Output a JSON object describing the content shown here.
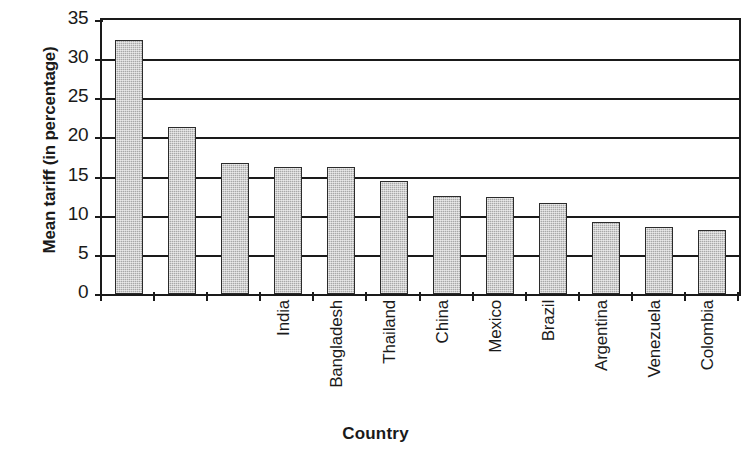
{
  "chart_data": {
    "type": "bar",
    "title": "",
    "xlabel": "Country",
    "ylabel": "Mean tariff (in percentage)",
    "categories": [
      "India",
      "Bangladesh",
      "Thailand",
      "China",
      "Mexico",
      "Brazil",
      "Argentina",
      "Venezuela",
      "Colombia",
      "Malaysia",
      "Korea",
      "Indonesia"
    ],
    "values": [
      32.4,
      21.3,
      16.7,
      16.2,
      16.2,
      14.4,
      12.5,
      12.4,
      11.6,
      9.2,
      8.5,
      8.2
    ],
    "ylim": [
      0,
      35
    ],
    "ytick_labels": [
      "0",
      "5",
      "10",
      "15",
      "20",
      "25",
      "30",
      "35"
    ],
    "ytick_values": [
      0,
      5,
      10,
      15,
      20,
      25,
      30,
      35
    ],
    "grid": true,
    "grid_axis": "y",
    "legend": false,
    "bar_color": "#a8a8a8",
    "bar_border_color": "#2b2b2b",
    "axis_color": "#1a1a1a",
    "background": "#ffffff"
  },
  "axes": {
    "y_title": "Mean tariff (in percentage)",
    "x_title": "Country"
  }
}
